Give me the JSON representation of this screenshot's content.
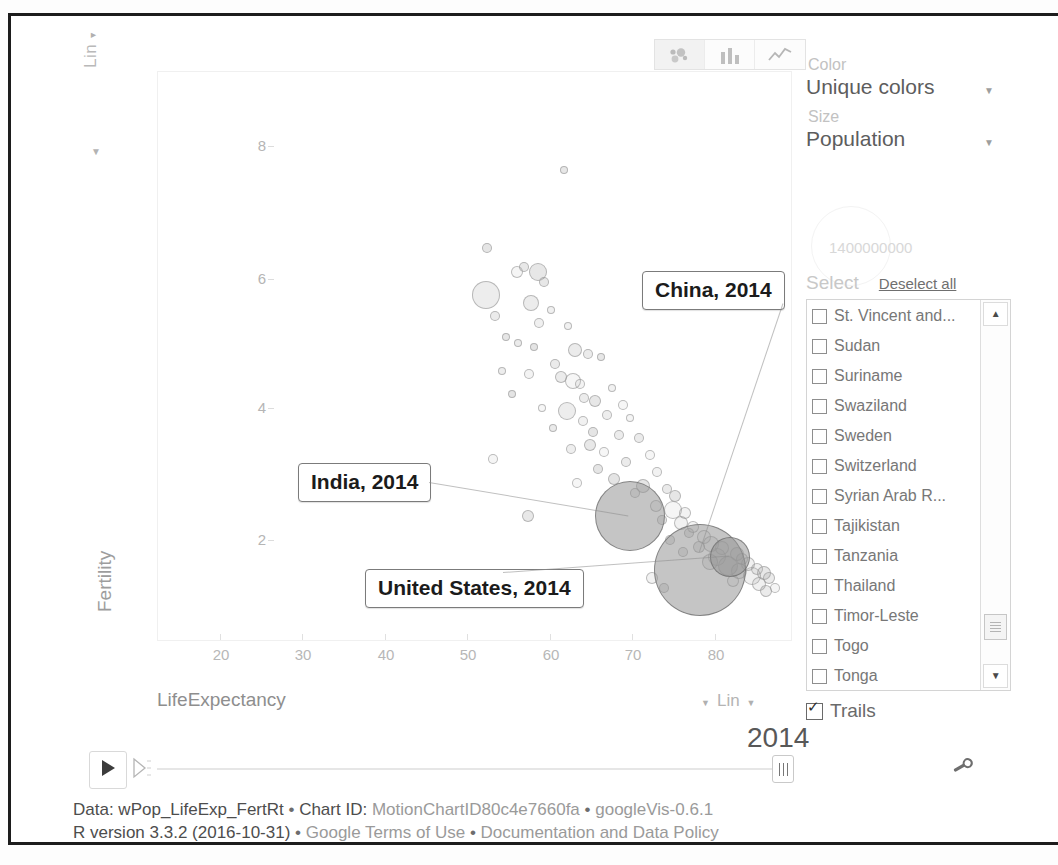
{
  "chart_tabs": [
    {
      "id": "bubble",
      "icon": "bubble-chart-icon",
      "selected": true
    },
    {
      "id": "bar",
      "icon": "bar-chart-icon",
      "selected": false
    },
    {
      "id": "line",
      "icon": "line-chart-icon",
      "selected": false
    }
  ],
  "axes": {
    "y_scale_label": "Lin",
    "x_scale_label": "Lin",
    "y_title": "Fertility",
    "x_title": "LifeExpectancy"
  },
  "panel": {
    "color_label": "Color",
    "color_value": "Unique colors",
    "size_label": "Size",
    "size_value": "Population",
    "size_legend_max": "1400000000",
    "select_label": "Select",
    "deselect_all_label": "Deselect all",
    "trails_label": "Trails",
    "trails_checked": true,
    "countries": [
      "St. Vincent and...",
      "Sudan",
      "Suriname",
      "Swaziland",
      "Sweden",
      "Switzerland",
      "Syrian Arab R...",
      "Tajikistan",
      "Tanzania",
      "Thailand",
      "Timor-Leste",
      "Togo",
      "Tonga"
    ]
  },
  "playback": {
    "year": "2014",
    "play_icon": "play-icon",
    "speed_icon": "speed-icon",
    "thumb_icon": "slider-thumb-icon",
    "settings_icon": "wrench-icon"
  },
  "annotations": [
    {
      "label": "China, 2014"
    },
    {
      "label": "India, 2014"
    },
    {
      "label": "United States, 2014"
    }
  ],
  "footer": {
    "line1_prefix": "Data: wPop_LifeExp_FertRt",
    "line1_chart_id_label": "Chart ID:",
    "line1_chart_id": "MotionChartID80c4e7660fa",
    "line1_version": "googleVis-0.6.1",
    "line2_r": "R version 3.3.2 (2016-10-31)",
    "line2_terms": "Google Terms of Use",
    "line2_docs": "Documentation and Data Policy",
    "separator": "•"
  },
  "chart_data": {
    "type": "scatter",
    "title": "",
    "xlabel": "LifeExpectancy",
    "ylabel": "Fertility",
    "xlim": [
      16,
      86
    ],
    "ylim": [
      0.6,
      9.0
    ],
    "xticks": [
      20,
      30,
      40,
      50,
      60,
      70,
      80
    ],
    "yticks": [
      2,
      4,
      6,
      8
    ],
    "grid": false,
    "legend": "none",
    "size_variable": "Population",
    "color_variable": "Unique colors",
    "year": 2014,
    "size_legend_max": 1400000000,
    "annotated_points": [
      {
        "name": "China, 2014",
        "x": 75.8,
        "y": 1.66,
        "r": 46
      },
      {
        "name": "India, 2014",
        "x": 68.0,
        "y": 2.45,
        "r": 35
      },
      {
        "name": "United States, 2014",
        "x": 79.1,
        "y": 1.86,
        "r": 20
      }
    ],
    "points": [
      {
        "x": 60.8,
        "y": 7.55,
        "r": 4
      },
      {
        "x": 52.3,
        "y": 6.4,
        "r": 5
      },
      {
        "x": 55.6,
        "y": 6.05,
        "r": 6
      },
      {
        "x": 56.4,
        "y": 6.12,
        "r": 5
      },
      {
        "x": 57.9,
        "y": 6.05,
        "r": 9
      },
      {
        "x": 58.6,
        "y": 5.9,
        "r": 5
      },
      {
        "x": 52.2,
        "y": 5.72,
        "r": 14
      },
      {
        "x": 57.1,
        "y": 5.6,
        "r": 8
      },
      {
        "x": 59.3,
        "y": 5.5,
        "r": 4
      },
      {
        "x": 53.1,
        "y": 5.4,
        "r": 5
      },
      {
        "x": 58.0,
        "y": 5.3,
        "r": 5
      },
      {
        "x": 61.2,
        "y": 5.25,
        "r": 4
      },
      {
        "x": 54.4,
        "y": 5.1,
        "r": 4
      },
      {
        "x": 55.7,
        "y": 5.0,
        "r": 4
      },
      {
        "x": 57.5,
        "y": 4.95,
        "r": 4
      },
      {
        "x": 62.0,
        "y": 4.9,
        "r": 7
      },
      {
        "x": 63.4,
        "y": 4.85,
        "r": 5
      },
      {
        "x": 64.8,
        "y": 4.8,
        "r": 4
      },
      {
        "x": 59.8,
        "y": 4.7,
        "r": 5
      },
      {
        "x": 53.9,
        "y": 4.6,
        "r": 4
      },
      {
        "x": 56.9,
        "y": 4.55,
        "r": 5
      },
      {
        "x": 60.4,
        "y": 4.5,
        "r": 6
      },
      {
        "x": 61.8,
        "y": 4.45,
        "r": 8
      },
      {
        "x": 62.5,
        "y": 4.4,
        "r": 5
      },
      {
        "x": 66.1,
        "y": 4.35,
        "r": 4
      },
      {
        "x": 55.0,
        "y": 4.25,
        "r": 4
      },
      {
        "x": 63.0,
        "y": 4.2,
        "r": 5
      },
      {
        "x": 64.2,
        "y": 4.15,
        "r": 6
      },
      {
        "x": 67.3,
        "y": 4.1,
        "r": 5
      },
      {
        "x": 58.3,
        "y": 4.05,
        "r": 4
      },
      {
        "x": 61.1,
        "y": 4.0,
        "r": 9
      },
      {
        "x": 65.5,
        "y": 3.95,
        "r": 5
      },
      {
        "x": 68.0,
        "y": 3.9,
        "r": 4
      },
      {
        "x": 62.8,
        "y": 3.85,
        "r": 5
      },
      {
        "x": 59.5,
        "y": 3.75,
        "r": 4
      },
      {
        "x": 64.0,
        "y": 3.7,
        "r": 5
      },
      {
        "x": 66.8,
        "y": 3.65,
        "r": 5
      },
      {
        "x": 69.0,
        "y": 3.6,
        "r": 5
      },
      {
        "x": 63.6,
        "y": 3.5,
        "r": 6
      },
      {
        "x": 61.5,
        "y": 3.45,
        "r": 5
      },
      {
        "x": 65.2,
        "y": 3.4,
        "r": 5
      },
      {
        "x": 70.2,
        "y": 3.35,
        "r": 5
      },
      {
        "x": 52.9,
        "y": 3.3,
        "r": 5
      },
      {
        "x": 67.6,
        "y": 3.25,
        "r": 5
      },
      {
        "x": 64.5,
        "y": 3.15,
        "r": 5
      },
      {
        "x": 71.0,
        "y": 3.1,
        "r": 5
      },
      {
        "x": 66.3,
        "y": 3.0,
        "r": 6
      },
      {
        "x": 62.2,
        "y": 2.95,
        "r": 5
      },
      {
        "x": 69.5,
        "y": 2.9,
        "r": 7
      },
      {
        "x": 72.1,
        "y": 2.85,
        "r": 5
      },
      {
        "x": 68.6,
        "y": 2.8,
        "r": 5
      },
      {
        "x": 73.0,
        "y": 2.75,
        "r": 6
      },
      {
        "x": 56.8,
        "y": 2.45,
        "r": 6
      },
      {
        "x": 70.9,
        "y": 2.6,
        "r": 6
      },
      {
        "x": 72.8,
        "y": 2.55,
        "r": 9
      },
      {
        "x": 74.1,
        "y": 2.5,
        "r": 6
      },
      {
        "x": 71.6,
        "y": 2.4,
        "r": 5
      },
      {
        "x": 73.6,
        "y": 2.35,
        "r": 7
      },
      {
        "x": 75.0,
        "y": 2.3,
        "r": 6
      },
      {
        "x": 74.5,
        "y": 2.2,
        "r": 5
      },
      {
        "x": 76.2,
        "y": 2.15,
        "r": 7
      },
      {
        "x": 72.4,
        "y": 2.1,
        "r": 5
      },
      {
        "x": 77.0,
        "y": 2.05,
        "r": 8
      },
      {
        "x": 75.6,
        "y": 2.0,
        "r": 6
      },
      {
        "x": 78.2,
        "y": 1.98,
        "r": 7
      },
      {
        "x": 73.9,
        "y": 1.92,
        "r": 5
      },
      {
        "x": 79.8,
        "y": 1.9,
        "r": 7
      },
      {
        "x": 77.6,
        "y": 1.85,
        "r": 9
      },
      {
        "x": 80.4,
        "y": 1.82,
        "r": 6
      },
      {
        "x": 76.8,
        "y": 1.78,
        "r": 8
      },
      {
        "x": 81.0,
        "y": 1.75,
        "r": 7
      },
      {
        "x": 78.8,
        "y": 1.72,
        "r": 10
      },
      {
        "x": 82.0,
        "y": 1.68,
        "r": 6
      },
      {
        "x": 80.0,
        "y": 1.65,
        "r": 8
      },
      {
        "x": 82.8,
        "y": 1.62,
        "r": 7
      },
      {
        "x": 81.5,
        "y": 1.58,
        "r": 9
      },
      {
        "x": 83.4,
        "y": 1.55,
        "r": 6
      },
      {
        "x": 79.4,
        "y": 1.5,
        "r": 6
      },
      {
        "x": 82.3,
        "y": 1.45,
        "r": 7
      },
      {
        "x": 70.5,
        "y": 1.55,
        "r": 6
      },
      {
        "x": 84.0,
        "y": 1.4,
        "r": 5
      },
      {
        "x": 71.8,
        "y": 1.4,
        "r": 5
      },
      {
        "x": 83.0,
        "y": 1.35,
        "r": 6
      }
    ]
  }
}
